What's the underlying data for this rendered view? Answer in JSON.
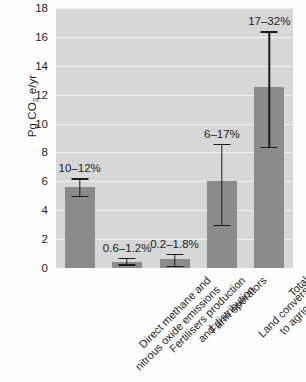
{
  "chart_data": {
    "type": "bar",
    "title": "",
    "xlabel": "",
    "ylabel": "Pg CO2 e/yr",
    "ylabel_parts": {
      "pre": "Pg CO",
      "sub": "2",
      "post": " e/yr"
    },
    "ylim": [
      0,
      18
    ],
    "ytick_values": [
      0,
      2,
      4,
      6,
      8,
      10,
      12,
      14,
      16,
      18
    ],
    "ytick_labels": [
      "0",
      "2",
      "4",
      "6",
      "8",
      "10",
      "12",
      "14",
      "16",
      "18"
    ],
    "grid": true,
    "grid_axis": "y",
    "legend": "none",
    "categories": [
      "Direct methane and nitrous oxide emissions",
      "Fertilisers production and distribution",
      "Farm operators",
      "Land conversion to agriculture",
      "Total"
    ],
    "category_lines": [
      [
        "Direct methane and",
        "nitrous oxide emissions"
      ],
      [
        "Fertilisers production",
        "and distribution"
      ],
      [
        "Farm operators",
        ""
      ],
      [
        "Land conversion",
        "to agriculture"
      ],
      [
        "Total",
        ""
      ]
    ],
    "values": [
      5.6,
      0.45,
      0.6,
      6.0,
      12.5
    ],
    "err_low": [
      5.0,
      0.25,
      0.15,
      3.0,
      8.4
    ],
    "err_high": [
      6.2,
      0.7,
      1.0,
      8.6,
      16.4
    ],
    "annotations": [
      "10–12%",
      "0.6–1.2%",
      "0.2–1.8%",
      "6–17%",
      "17–32%"
    ],
    "annotation_label": "share of global anthropogenic emissions",
    "colors": {
      "bar": "#8b8b8b",
      "plot_background": "#d7d7d7",
      "grid": "#f2f2f2",
      "error_bar": "#1c1c1c",
      "text": "#1f1f1f",
      "figure_background": "#fdfdfd"
    }
  }
}
